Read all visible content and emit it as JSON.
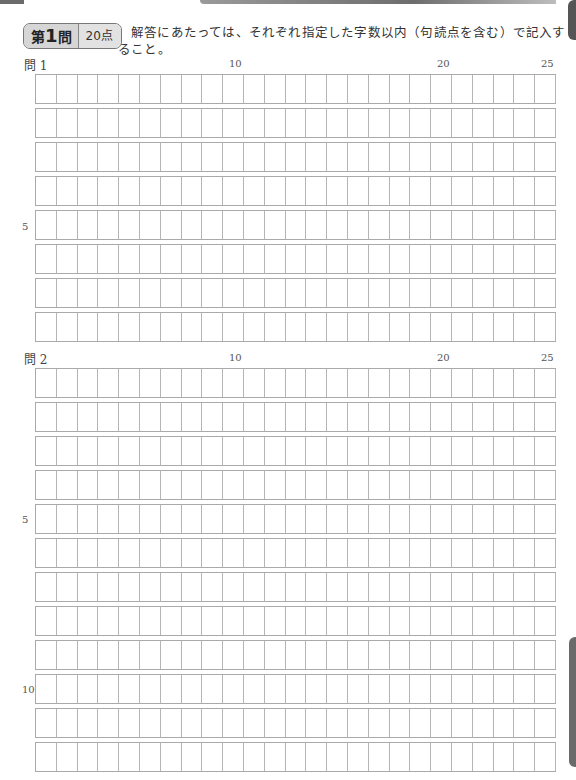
{
  "header": {
    "question_badge": {
      "prefix": "第",
      "number": "1",
      "suffix": "問"
    },
    "points_badge": "20点",
    "instruction": "解答にあたっては、それぞれ指定した字数以内（句読点を含む）で記入すること。"
  },
  "questions": [
    {
      "label": "問 1",
      "columns": 25,
      "rows": 8,
      "column_markers": [
        "10",
        "20",
        "25"
      ],
      "row_markers": [
        "5"
      ]
    },
    {
      "label": "問 2",
      "columns": 25,
      "rows": 12,
      "column_markers": [
        "10",
        "20",
        "25"
      ],
      "row_markers": [
        "5",
        "10"
      ]
    }
  ]
}
